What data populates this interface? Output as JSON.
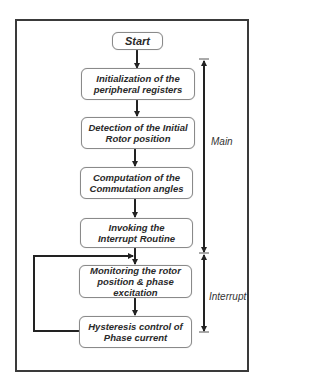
{
  "diagram": {
    "type": "flowchart",
    "nodes": [
      {
        "id": "start",
        "lines": [
          "Start"
        ]
      },
      {
        "id": "init",
        "lines": [
          "Initialization of the",
          "peripheral registers"
        ]
      },
      {
        "id": "detect",
        "lines": [
          "Detection of the Initial",
          "Rotor position"
        ]
      },
      {
        "id": "compute",
        "lines": [
          "Computation of the",
          "Commutation angles"
        ]
      },
      {
        "id": "invoke",
        "lines": [
          "Invoking the",
          "Interrupt Routine"
        ]
      },
      {
        "id": "monitor",
        "lines": [
          "Monitoring the rotor",
          "position & phase",
          "excitation"
        ]
      },
      {
        "id": "hysteresis",
        "lines": [
          "Hysteresis control of",
          "Phase current"
        ]
      }
    ],
    "edges": [
      [
        "start",
        "init"
      ],
      [
        "init",
        "detect"
      ],
      [
        "detect",
        "compute"
      ],
      [
        "compute",
        "invoke"
      ],
      [
        "invoke",
        "monitor"
      ],
      [
        "monitor",
        "hysteresis"
      ],
      [
        "hysteresis",
        "monitor"
      ]
    ],
    "section_labels": {
      "main": "Main",
      "interrupt": "Interrupt"
    }
  }
}
